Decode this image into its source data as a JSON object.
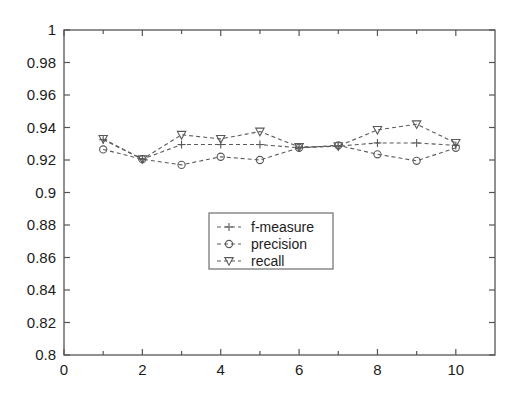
{
  "chart_data": {
    "type": "line",
    "title": "",
    "xlabel": "",
    "ylabel": "",
    "xlim": [
      0,
      11
    ],
    "ylim": [
      0.8,
      1.0
    ],
    "xticks": [
      0,
      2,
      4,
      6,
      8,
      10
    ],
    "xtick_labels": [
      "0",
      "2",
      "4",
      "6",
      "8",
      "10"
    ],
    "xticks_minor": [
      1,
      3,
      5,
      7,
      9
    ],
    "yticks": [
      0.8,
      0.82,
      0.84,
      0.86,
      0.88,
      0.9,
      0.92,
      0.94,
      0.96,
      0.98,
      1.0
    ],
    "ytick_labels": [
      "0.8",
      "0.82",
      "0.84",
      "0.86",
      "0.88",
      "0.9",
      "0.92",
      "0.94",
      "0.96",
      "0.98",
      "1"
    ],
    "grid": false,
    "legend_position": "center",
    "x": [
      1,
      2,
      3,
      4,
      5,
      6,
      7,
      8,
      9,
      10
    ],
    "series": [
      {
        "name": "f-measure",
        "marker": "plus",
        "color": "#5a5a5a",
        "linestyle": "dashed",
        "values": [
          0.9325,
          0.9205,
          0.9295,
          0.9295,
          0.9295,
          0.9275,
          0.9285,
          0.9305,
          0.9305,
          0.929
        ]
      },
      {
        "name": "precision",
        "marker": "circle",
        "color": "#5a5a5a",
        "linestyle": "dashed",
        "values": [
          0.9265,
          0.9205,
          0.917,
          0.922,
          0.92,
          0.9275,
          0.929,
          0.9235,
          0.9195,
          0.9275
        ]
      },
      {
        "name": "recall",
        "marker": "triangle-down",
        "color": "#5a5a5a",
        "linestyle": "dashed",
        "values": [
          0.933,
          0.9205,
          0.9355,
          0.933,
          0.9375,
          0.928,
          0.9285,
          0.9385,
          0.942,
          0.9305
        ]
      }
    ]
  },
  "legend": {
    "entries": [
      {
        "label": "f-measure",
        "marker": "plus"
      },
      {
        "label": "precision",
        "marker": "circle"
      },
      {
        "label": "recall",
        "marker": "triangle-down"
      }
    ]
  },
  "colors": {
    "axis": "#555555",
    "series": "#5a5a5a",
    "background": "#ffffff",
    "text": "#1c1c1c"
  }
}
